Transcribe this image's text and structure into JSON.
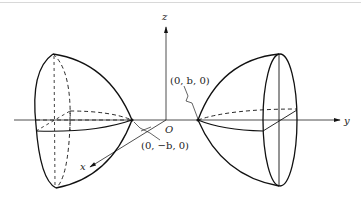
{
  "figure": {
    "axes": {
      "x_label": "x",
      "y_label": "y",
      "z_label": "z",
      "origin_label": "O"
    },
    "points": {
      "vertex_positive": "(0, b, 0)",
      "vertex_negative": "(0, −b, 0)"
    },
    "colors": {
      "stroke": "#111111",
      "background": "#ffffff"
    }
  }
}
